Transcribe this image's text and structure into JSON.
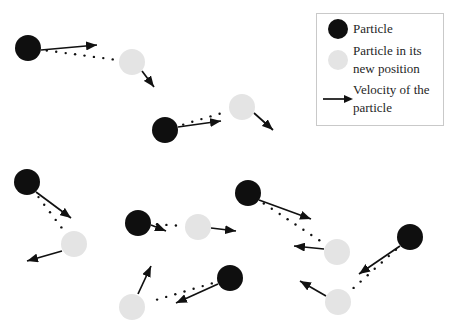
{
  "colors": {
    "background": "#ffffff",
    "particle": "#0f0f0f",
    "particle_new_position": "#e4e4e4",
    "arrow": "#111111",
    "trail_dot": "#111111",
    "legend_border": "#c9c9c9",
    "legend_background": "#ffffff",
    "text": "#1f1f1f"
  },
  "legend": {
    "items": [
      {
        "icon": "particle-icon",
        "lines": [
          "Particle"
        ]
      },
      {
        "icon": "particle-new-position-icon",
        "lines": [
          "Particle in its",
          "new position"
        ]
      },
      {
        "icon": "velocity-arrow-icon",
        "lines": [
          "Velocity of the",
          "particle"
        ]
      }
    ]
  },
  "diagram": {
    "particle_radius": 13,
    "trail_dot_spacing": 9.5,
    "trail_dot_radius": 1.2,
    "arrow_stroke_width": 1.7,
    "pairs": [
      {
        "black": {
          "x": 28,
          "y": 48
        },
        "gray": {
          "x": 132,
          "y": 62
        },
        "black_arrow": {
          "x1": 41,
          "y1": 50,
          "x2": 97,
          "y2": 45
        },
        "gray_arrow": {
          "x1": 142,
          "y1": 71,
          "x2": 154,
          "y2": 87
        }
      },
      {
        "black": {
          "x": 165,
          "y": 130
        },
        "gray": {
          "x": 242,
          "y": 107
        },
        "black_arrow": {
          "x1": 178,
          "y1": 127,
          "x2": 221,
          "y2": 121
        },
        "gray_arrow": {
          "x1": 254,
          "y1": 113,
          "x2": 273,
          "y2": 130
        }
      },
      {
        "black": {
          "x": 27,
          "y": 182
        },
        "gray": {
          "x": 74,
          "y": 244
        },
        "black_arrow": {
          "x1": 36,
          "y1": 192,
          "x2": 71,
          "y2": 218
        },
        "gray_arrow": {
          "x1": 62,
          "y1": 251,
          "x2": 27,
          "y2": 261
        }
      },
      {
        "black": {
          "x": 138,
          "y": 223
        },
        "gray": {
          "x": 198,
          "y": 227
        },
        "black_arrow": {
          "x1": 151,
          "y1": 225,
          "x2": 166,
          "y2": 231
        },
        "gray_arrow": {
          "x1": 211,
          "y1": 228,
          "x2": 236,
          "y2": 231
        }
      },
      {
        "black": {
          "x": 230,
          "y": 278
        },
        "gray": {
          "x": 132,
          "y": 307
        },
        "black_arrow": {
          "x1": 218,
          "y1": 284,
          "x2": 176,
          "y2": 303
        },
        "gray_arrow": {
          "x1": 138,
          "y1": 294,
          "x2": 151,
          "y2": 266
        }
      },
      {
        "black": {
          "x": 248,
          "y": 193
        },
        "gray": {
          "x": 337,
          "y": 252
        },
        "black_arrow": {
          "x1": 259,
          "y1": 200,
          "x2": 311,
          "y2": 219
        },
        "gray_arrow": {
          "x1": 324,
          "y1": 249,
          "x2": 294,
          "y2": 246
        }
      },
      {
        "black": {
          "x": 410,
          "y": 237
        },
        "gray": {
          "x": 338,
          "y": 302
        },
        "black_arrow": {
          "x1": 400,
          "y1": 246,
          "x2": 359,
          "y2": 274
        },
        "gray_arrow": {
          "x1": 326,
          "y1": 296,
          "x2": 300,
          "y2": 281
        }
      }
    ]
  }
}
